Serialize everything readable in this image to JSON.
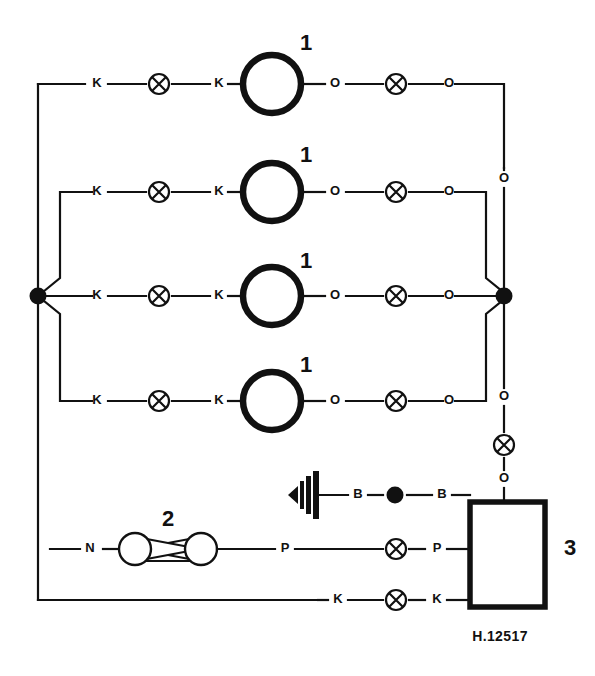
{
  "diagram": {
    "caption": "H.12517",
    "colors": {
      "line": "#111111",
      "background": "#ffffff"
    },
    "component_labels": {
      "lamp": "1",
      "pump": "2",
      "unit": "3"
    },
    "terminal_letters": {
      "k": "K",
      "o": "O",
      "b": "B",
      "p": "P",
      "n": "N"
    },
    "lamp_rows": [
      {
        "index": 1,
        "number": "1",
        "left_terminal": "K",
        "left_inner_terminal": "K",
        "right_terminal": "O",
        "right_outer_terminal": "O"
      },
      {
        "index": 2,
        "number": "1",
        "left_terminal": "K",
        "left_inner_terminal": "K",
        "right_terminal": "O",
        "right_outer_terminal": "O"
      },
      {
        "index": 3,
        "number": "1",
        "left_terminal": "K",
        "left_inner_terminal": "K",
        "right_terminal": "O",
        "right_outer_terminal": "O"
      },
      {
        "index": 4,
        "number": "1",
        "left_terminal": "K",
        "left_inner_terminal": "K",
        "right_terminal": "O",
        "right_outer_terminal": "O"
      }
    ],
    "right_bus": {
      "upper_terminal": "O",
      "lower_terminal": "O",
      "connector_terminal": "O"
    },
    "bottom_rows": {
      "horn_row": {
        "left_terminal": "B",
        "right_terminal": "B",
        "icon": "horn-icon"
      },
      "pump_row": {
        "left_terminal": "N",
        "mid_terminal": "P",
        "right_terminal": "P",
        "number": "2"
      },
      "ground_row": {
        "left_terminal": "K",
        "right_terminal": "K"
      }
    },
    "unit_box": {
      "label": "3"
    }
  }
}
